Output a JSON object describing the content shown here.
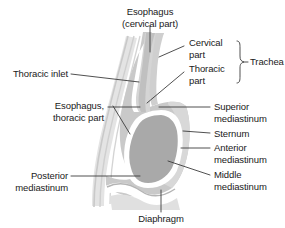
{
  "figure": {
    "kind": "anatomical-diagram",
    "background_color": "#ffffff",
    "line_color": "#3c3c3c",
    "text_color": "#1a1a1a",
    "colors": {
      "body_light_gray": "#dcdcdc",
      "body_mid_gray": "#c6c6c6",
      "heart_gray": "#a9a9a9",
      "outline_white": "#ffffff",
      "spine_line": "#cfcfcf"
    }
  },
  "labels": {
    "esophagus_cervical": "Esophagus\n(cervical part)",
    "cervical_part": "Cervical\npart",
    "thoracic_part": "Thoracic\npart",
    "trachea": "Trachea",
    "thoracic_inlet": "Thoracic inlet",
    "esophagus_thoracic": "Esophagus,\nthoracic part",
    "superior_mediastinum": "Superior\nmediastinum",
    "sternum": "Sternum",
    "anterior_mediastinum": "Anterior\nmediastinum",
    "middle_mediastinum": "Middle\nmediastinum",
    "posterior_mediastinum": "Posterior\nmediastinum",
    "diaphragm": "Diaphragm"
  }
}
